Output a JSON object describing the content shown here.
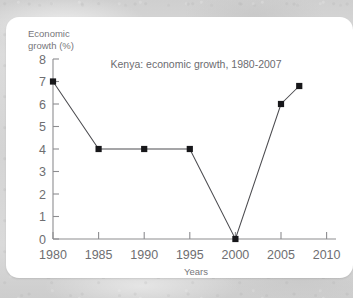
{
  "chart_data": {
    "type": "line",
    "title": "Kenya: economic growth, 1980-2007",
    "xlabel": "Years",
    "ylabel": "Economic growth (%)",
    "ylabel_line1": "Economic",
    "ylabel_line2": "growth (%)",
    "x": [
      1980,
      1985,
      1990,
      1995,
      2000,
      2005,
      2007
    ],
    "values": [
      7,
      4,
      4,
      4,
      0,
      6,
      6.8
    ],
    "xlim": [
      1980,
      2011
    ],
    "ylim": [
      0,
      8
    ],
    "xticks": [
      1980,
      1985,
      1990,
      1995,
      2000,
      2005,
      2010
    ],
    "yticks": [
      0,
      1,
      2,
      3,
      4,
      5,
      6,
      7,
      8
    ],
    "xtick_labels": [
      "1980",
      "1985",
      "1990",
      "1995",
      "2000",
      "2005",
      "2010"
    ],
    "ytick_labels": [
      "0",
      "1",
      "2",
      "3",
      "4",
      "5",
      "6",
      "7",
      "8"
    ],
    "grid": false,
    "legend": null,
    "marker": "square",
    "line_color": "#4c4c50",
    "marker_color": "#17171a",
    "axis_color": "#8d8d90",
    "text_color": "#6e6e71",
    "background_color": "#ffffff"
  }
}
